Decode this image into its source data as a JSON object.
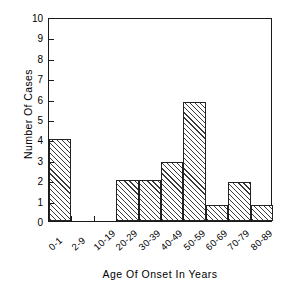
{
  "chart_data": {
    "type": "bar",
    "title": "",
    "xlabel": "Age Of Onset In Years",
    "ylabel": "Number Of Cases",
    "categories": [
      "0-1",
      "2-9",
      "10-19",
      "20-29",
      "30-39",
      "40-49",
      "50-59",
      "60-69",
      "70-79",
      "80-89"
    ],
    "values": [
      4,
      0,
      0,
      2,
      2,
      2.9,
      5.85,
      0.8,
      1.9,
      0.8
    ],
    "ylim": [
      0,
      10
    ],
    "yticks": [
      "0",
      "1",
      "2",
      "3",
      "4",
      "5",
      "6",
      "7",
      "8",
      "9",
      "10"
    ],
    "ytick_values": [
      0,
      1,
      2,
      3,
      4,
      5,
      6,
      7,
      8,
      9,
      10
    ],
    "grid": false,
    "legend": false,
    "bar_fill": "diagonal-hatch",
    "frame_color": "#1a1a1a",
    "background": "#ffffff"
  }
}
